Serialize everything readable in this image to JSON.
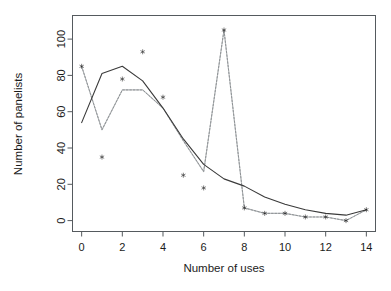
{
  "chart_data": {
    "type": "scatter",
    "title": "",
    "subtitle": "",
    "xlabel": "Number of uses",
    "ylabel": "Number of panelists",
    "xlim": [
      -0.45,
      14.45
    ],
    "ylim": [
      -6,
      113
    ],
    "xticks": [
      0,
      2,
      4,
      6,
      8,
      10,
      12,
      14
    ],
    "xtick_labels": [
      "0",
      "2",
      "4",
      "6",
      "8",
      "10",
      "12",
      "14"
    ],
    "yticks": [
      0,
      20,
      40,
      60,
      80,
      100
    ],
    "ytick_labels": [
      "0",
      "20",
      "40",
      "60",
      "80",
      "100"
    ],
    "grid": false,
    "legend": "none",
    "box": true,
    "x": [
      0,
      1,
      2,
      3,
      4,
      5,
      6,
      7,
      8,
      9,
      10,
      11,
      12,
      13,
      14
    ],
    "series": [
      {
        "name": "Observed panelists",
        "type": "scatter",
        "marker": "star",
        "color": "#141414",
        "values": [
          85,
          35,
          78,
          93,
          68,
          25,
          18,
          105,
          7,
          4,
          4,
          2,
          2,
          0,
          6
        ]
      },
      {
        "name": "Fitted smooth curve",
        "type": "line",
        "style": "solid",
        "color": "#3a3a3a",
        "x": [
          0,
          1,
          2,
          3,
          4,
          5,
          6,
          7,
          8,
          9,
          10,
          11,
          12,
          13,
          14
        ],
        "values": [
          54,
          81,
          85,
          77,
          62,
          45,
          31,
          23,
          19,
          13,
          9,
          6,
          4,
          3,
          6
        ]
      },
      {
        "name": "Connected observations",
        "type": "line",
        "style": "dotted",
        "color": "#b9bcbe",
        "x": [
          0,
          1,
          2,
          3,
          4,
          5,
          6,
          7,
          8,
          9,
          10,
          11,
          12,
          13,
          14
        ],
        "values": [
          85,
          50,
          72,
          72,
          62,
          44,
          27,
          105,
          7,
          4,
          4,
          2,
          2,
          0,
          6
        ]
      }
    ]
  },
  "axes": {
    "x_title": "Number of uses",
    "y_title": "Number of panelists"
  }
}
